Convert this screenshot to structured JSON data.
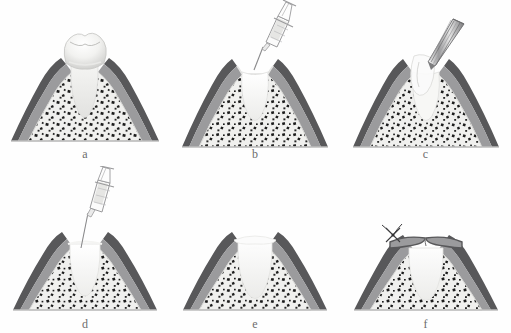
{
  "figure": {
    "layout": {
      "rows": 2,
      "columns": 3,
      "width": 511,
      "height": 333
    },
    "style": "grayscale medical line illustration"
  },
  "colors": {
    "background": "#ffffff",
    "gingiva_outer": "#58585a",
    "gingiva_mid": "#9b9b9d",
    "gingiva_inner": "#b4b4b6",
    "bone_fill": "#f0f0ee",
    "bone_speckle": "#1c1c1c",
    "tooth_light": "#fafafa",
    "tooth_shadow": "#d9d9d9",
    "socket_fill": "#f4f4f2",
    "graft_fill": "#f6f6f4",
    "instrument_stroke": "#777779",
    "syringe_fluid": "#e6e6e4",
    "baseline": "#bdbdbd",
    "label_text": "#6d6d6d"
  },
  "panels": [
    {
      "id": "a",
      "label": "a",
      "caption": "Tooth in situ prior to extraction",
      "has_tooth": true,
      "has_syringe": false,
      "has_curette": false,
      "has_graft": false,
      "has_suture": false,
      "socket_state": "occupied-by-root"
    },
    {
      "id": "b",
      "label": "b",
      "caption": "Irrigation of the empty extraction socket with a syringe",
      "has_tooth": false,
      "has_syringe": true,
      "has_curette": false,
      "has_graft": false,
      "has_suture": false,
      "socket_state": "empty"
    },
    {
      "id": "c",
      "label": "c",
      "caption": "Debridement of the socket with a tapered hand instrument",
      "has_tooth": false,
      "has_syringe": false,
      "has_curette": true,
      "has_graft": false,
      "has_suture": false,
      "socket_state": "debrided"
    },
    {
      "id": "d",
      "label": "d",
      "caption": "Delivery of graft material into the socket by syringe",
      "has_tooth": false,
      "has_syringe": true,
      "has_curette": false,
      "has_graft": true,
      "has_suture": false,
      "socket_state": "being-filled"
    },
    {
      "id": "e",
      "label": "e",
      "caption": "Socket completely filled with graft material",
      "has_tooth": false,
      "has_syringe": false,
      "has_curette": false,
      "has_graft": true,
      "has_suture": false,
      "socket_state": "grafted"
    },
    {
      "id": "f",
      "label": "f",
      "caption": "Soft tissue flaps approximated and closed with a suture",
      "has_tooth": false,
      "has_syringe": false,
      "has_curette": false,
      "has_graft": true,
      "has_suture": true,
      "socket_state": "closed"
    }
  ]
}
